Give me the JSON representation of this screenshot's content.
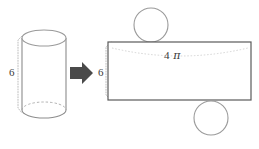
{
  "figure": {
    "background_color": "#ffffff"
  },
  "labels": {
    "cylinder_height": "6",
    "rect_height": "6",
    "rect_width_number": "4",
    "rect_width_symbol": "π"
  },
  "colors": {
    "outline_gray": "#8c8c8c",
    "outline_dark": "#6b6b6b",
    "rect_stroke": "#5a5a5a",
    "dotted_gray": "#b5b5b5",
    "arrow_fill": "#4a4a4a",
    "text": "#3a3a3a",
    "circle_stroke": "#9a9a9a"
  },
  "shapes": {
    "cylinder": {
      "name": "cylinder",
      "center_x": 44,
      "top_ellipse_cy": 38,
      "bottom_ellipse_cy": 110,
      "rx": 22,
      "ry": 8
    },
    "arrow": {
      "name": "right-arrow",
      "x": 70,
      "y": 62,
      "width": 22,
      "height": 22
    },
    "rectangle": {
      "name": "net-rectangle",
      "x": 108,
      "y": 42,
      "width": 143,
      "height": 58
    },
    "top_circle": {
      "name": "top-base-circle",
      "cx": 151,
      "cy": 25,
      "r": 17
    },
    "bottom_circle": {
      "name": "bottom-base-circle",
      "cx": 211,
      "cy": 118,
      "r": 17
    }
  }
}
